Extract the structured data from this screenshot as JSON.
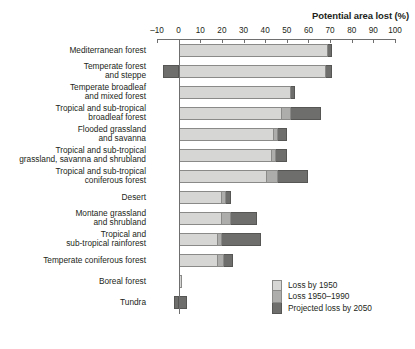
{
  "chart_data": {
    "type": "bar",
    "orientation": "horizontal",
    "stacked": true,
    "title": "",
    "xlabel": "Potential area lost (%)",
    "ylabel": "Biome",
    "xlim": [
      -10,
      100
    ],
    "xticks": [
      -10,
      0,
      10,
      20,
      30,
      40,
      50,
      60,
      70,
      80,
      90,
      100
    ],
    "xticklabels": [
      "–10",
      "0",
      "10",
      "20",
      "30",
      "40",
      "50",
      "60",
      "70",
      "80",
      "90",
      "100"
    ],
    "grid": false,
    "legend_position": "bottom-right",
    "legend": [
      "Loss by 1950",
      "Loss 1950–1990",
      "Projected loss by 2050"
    ],
    "categories": [
      "Mediterranean forest",
      "Temperate forest and steppe",
      "Temperate broadleaf and mixed forest",
      "Tropical and sub-tropical broadleaf forest",
      "Flooded grassland and savanna",
      "Tropical and sub-tropical grassland, savanna and shrubland",
      "Tropical and sub-tropical coniferous forest",
      "Desert",
      "Montane grassland and shrubland",
      "Tropical and sub-tropical rainforest",
      "Temperate coniferous forest",
      "Boreal forest",
      "Tundra"
    ],
    "category_lines": [
      [
        "Mediterranean forest"
      ],
      [
        "Temperate forest",
        "and steppe"
      ],
      [
        "Temperate broadleaf",
        "and mixed forest"
      ],
      [
        "Tropical and sub-tropical",
        "broadleaf forest"
      ],
      [
        "Flooded grassland",
        "and savanna"
      ],
      [
        "Tropical and sub-tropical",
        "grassland, savanna and shrubland"
      ],
      [
        "Tropical and sub-tropical",
        "coniferous forest"
      ],
      [
        "Desert"
      ],
      [
        "Montane grassland",
        "and shrubland"
      ],
      [
        "Tropical and",
        "sub-tropical rainforest"
      ],
      [
        "Temperate coniferous forest"
      ],
      [
        "Boreal forest"
      ],
      [
        "Tundra"
      ]
    ],
    "series": [
      {
        "name": "Loss by 1950",
        "values": [
          69,
          68,
          52,
          48,
          44,
          43,
          41,
          20,
          20,
          18,
          18,
          1.5,
          0
        ]
      },
      {
        "name": "Loss 1950–1990",
        "values": [
          0,
          0,
          0,
          4,
          2,
          2,
          5,
          2,
          4,
          2,
          3,
          0,
          0
        ]
      },
      {
        "name": "Projected loss by 2050",
        "values": [
          2,
          3,
          2,
          14,
          4,
          5,
          14,
          2,
          12,
          18,
          4,
          0,
          4
        ]
      }
    ],
    "negative_values": [
      0,
      -7,
      0,
      0,
      0,
      0,
      0,
      0,
      0,
      0,
      0,
      0,
      -2
    ],
    "colors": {
      "loss_by_1950": "#d6d6d4",
      "loss_1950_1990": "#adadab",
      "projected_loss_by_2050": "#6e6e6c",
      "axis": "#6f6f6f",
      "text": "#231f20"
    }
  }
}
